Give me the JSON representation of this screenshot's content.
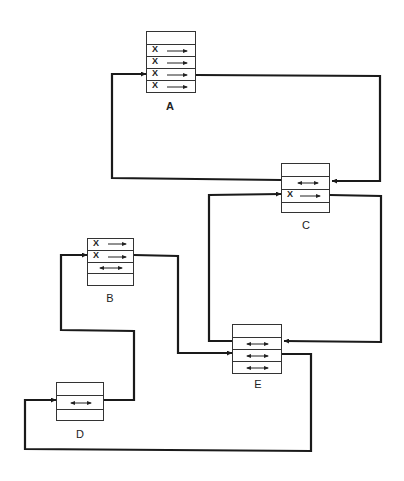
{
  "diagram": {
    "colors": {
      "line": "#1a1a1a",
      "box_border": "#333333",
      "background": "#ffffff"
    },
    "blocks": [
      {
        "id": "A",
        "label": "A",
        "rows": [
          {
            "mark": "",
            "arrow": "none"
          },
          {
            "mark": "X",
            "arrow": "right"
          },
          {
            "mark": "X",
            "arrow": "right"
          },
          {
            "mark": "X",
            "arrow": "right"
          },
          {
            "mark": "X",
            "arrow": "right"
          }
        ]
      },
      {
        "id": "C",
        "label": "C",
        "rows": [
          {
            "mark": "",
            "arrow": "none"
          },
          {
            "mark": "",
            "arrow": "both"
          },
          {
            "mark": "X",
            "arrow": "right"
          },
          {
            "mark": "",
            "arrow": "none"
          }
        ]
      },
      {
        "id": "B",
        "label": "B",
        "rows": [
          {
            "mark": "X",
            "arrow": "right"
          },
          {
            "mark": "X",
            "arrow": "right"
          },
          {
            "mark": "",
            "arrow": "both"
          },
          {
            "mark": "",
            "arrow": "none"
          }
        ]
      },
      {
        "id": "E",
        "label": "E",
        "rows": [
          {
            "mark": "",
            "arrow": "none"
          },
          {
            "mark": "",
            "arrow": "both"
          },
          {
            "mark": "",
            "arrow": "both"
          },
          {
            "mark": "",
            "arrow": "both"
          }
        ]
      },
      {
        "id": "D",
        "label": "D",
        "rows": [
          {
            "mark": "",
            "arrow": "none"
          },
          {
            "mark": "",
            "arrow": "both"
          },
          {
            "mark": "",
            "arrow": "none"
          }
        ]
      }
    ],
    "connections": [
      {
        "from": "A row 4 (right)",
        "to": "C row 2 (right)"
      },
      {
        "from": "C row 2 (left)",
        "to": "A row 4 (left)"
      },
      {
        "from": "C row 3 (right)",
        "to": "E row 2 (right)"
      },
      {
        "from": "E row 2 (left)",
        "to": "C row 3 (left)"
      },
      {
        "from": "B row 2 (right)",
        "to": "E row 3 (left)"
      },
      {
        "from": "E row 3 (right)",
        "to": "D row 2 (left)"
      },
      {
        "from": "D row 2 (right)",
        "to": "B row 2 (left)"
      }
    ]
  }
}
